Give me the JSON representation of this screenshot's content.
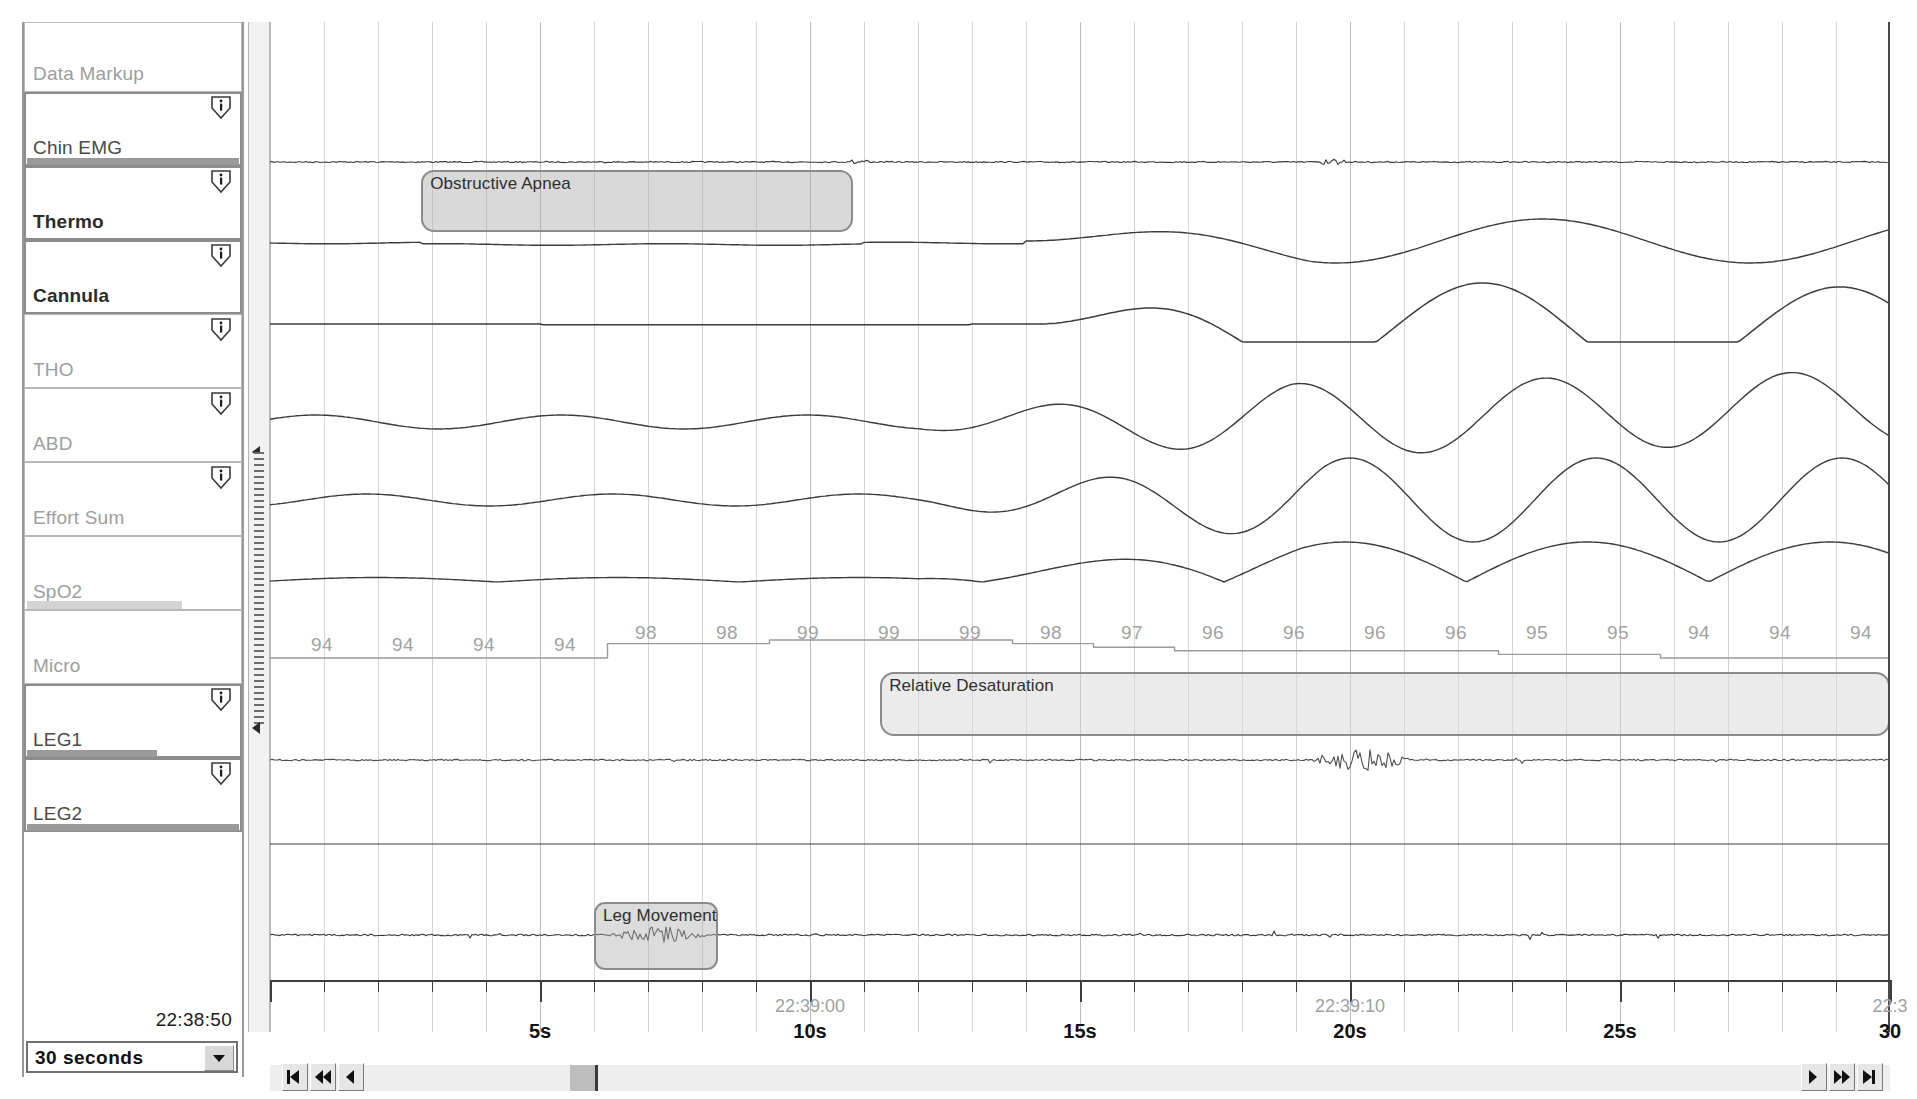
{
  "channels": [
    {
      "name": "Data Markup",
      "style": "plain",
      "selected": false,
      "info": false,
      "bar": null
    },
    {
      "name": "Chin EMG",
      "style": "dark",
      "selected": true,
      "info": true,
      "bar": {
        "kind": "dark",
        "width": 212
      }
    },
    {
      "name": "Thermo",
      "style": "bold",
      "selected": true,
      "info": true,
      "bar": null
    },
    {
      "name": "Cannula",
      "style": "bold",
      "selected": true,
      "info": true,
      "bar": null
    },
    {
      "name": "THO",
      "style": "plain",
      "selected": false,
      "info": true,
      "bar": null
    },
    {
      "name": "ABD",
      "style": "plain",
      "selected": false,
      "info": true,
      "bar": null
    },
    {
      "name": "Effort Sum",
      "style": "plain",
      "selected": false,
      "info": true,
      "bar": null
    },
    {
      "name": "SpO2",
      "style": "plain",
      "selected": false,
      "info": false,
      "bar": {
        "kind": "light",
        "width": 155
      }
    },
    {
      "name": "Micro",
      "style": "plain",
      "selected": false,
      "info": false,
      "bar": null
    },
    {
      "name": "LEG1",
      "style": "dark",
      "selected": true,
      "info": true,
      "bar": {
        "kind": "dark",
        "width": 130
      }
    },
    {
      "name": "LEG2",
      "style": "dark",
      "selected": true,
      "info": true,
      "bar": {
        "kind": "dark",
        "width": 212
      }
    }
  ],
  "footer": {
    "time_readout": "22:38:50",
    "duration_value": "30 seconds",
    "duration_options": [
      "10 seconds",
      "30 seconds",
      "60 seconds",
      "2 minutes",
      "5 minutes"
    ]
  },
  "nav": {
    "first_label": "|<",
    "rewind_label": "<<",
    "prev_label": "<",
    "next_label": ">",
    "forward_label": ">>",
    "last_label": ">|"
  },
  "events": [
    {
      "id": "obstructive-apnea",
      "label": "Obstructive Apnea",
      "start_s": 2.8,
      "end_s": 10.8,
      "channel": "Thermo"
    },
    {
      "id": "relative-desaturation",
      "label": "Relative Desaturation",
      "start_s": 11.3,
      "end_s": 30.0,
      "channel": "SpO2"
    },
    {
      "id": "leg-movement",
      "label": "Leg Movement",
      "start_s": 6.0,
      "end_s": 8.3,
      "channel": "LEG2"
    }
  ],
  "axis": {
    "labels": [
      "5s",
      "10s",
      "15s",
      "20s",
      "25s",
      "30"
    ],
    "label_seconds": [
      5,
      10,
      15,
      20,
      25,
      30
    ],
    "clock_labels": [
      "22:39:00",
      "22:39:10",
      "22:3"
    ],
    "clock_seconds": [
      10,
      20,
      30
    ],
    "start_clock": "22:38:50",
    "window_seconds": 30,
    "minor_tick_interval_s": 1
  },
  "chart_data": {
    "type": "line",
    "xlabel": "Time (s)",
    "ylabel": "",
    "xlim": [
      0,
      30
    ],
    "grid": true,
    "legend": "none",
    "spo2": {
      "label": "SpO2",
      "unit": "%",
      "tick_seconds": [
        1.0,
        2.5,
        4.0,
        5.5,
        7.0,
        8.5,
        10.0,
        11.5,
        13.0,
        14.5,
        16.0,
        17.5,
        19.0,
        20.5,
        22.0,
        23.5,
        25.0,
        26.5,
        28.0,
        29.5
      ],
      "values": [
        94,
        94,
        94,
        94,
        98,
        98,
        99,
        99,
        99,
        98,
        97,
        96,
        96,
        96,
        96,
        95,
        95,
        94,
        94,
        94
      ],
      "min": 94,
      "max": 99
    },
    "series": [
      {
        "name": "Chin EMG",
        "type": "emg",
        "baseline_y": 160,
        "amplitude": 1
      },
      {
        "name": "Thermo",
        "type": "airflow",
        "baseline_y": 248,
        "note": "flattened during apnea, recovery after 14s"
      },
      {
        "name": "Cannula",
        "type": "airflow",
        "baseline_y": 330,
        "note": "flat during apnea, large recovery breaths"
      },
      {
        "name": "THO",
        "type": "effort",
        "baseline_y": 425,
        "note": "reduced during apnea, crescendo after"
      },
      {
        "name": "ABD",
        "type": "effort",
        "baseline_y": 505,
        "note": "paradoxical/reduced then large"
      },
      {
        "name": "Effort Sum",
        "type": "effort",
        "baseline_y": 585,
        "note": "sum of THO+ABD"
      },
      {
        "name": "SpO2",
        "type": "saturation",
        "baseline_y": 640,
        "note": "step down from 99 to 94"
      },
      {
        "name": "Micro",
        "type": "snore",
        "baseline_y": 760,
        "note": "snore burst near 20s"
      },
      {
        "name": "LEG1",
        "type": "emg",
        "baseline_y": 850,
        "amplitude": 0
      },
      {
        "name": "LEG2",
        "type": "emg",
        "baseline_y": 935,
        "note": "burst 6-8.3s leg movement"
      }
    ]
  }
}
